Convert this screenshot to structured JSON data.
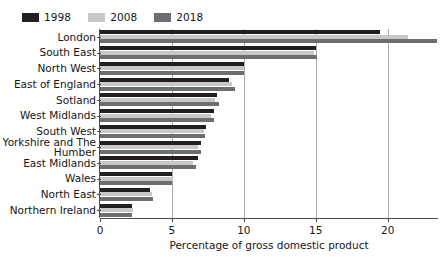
{
  "chart_data": {
    "type": "bar",
    "orientation": "horizontal",
    "title": "",
    "xlabel": "Percentage of gross domestic product",
    "ylabel": "",
    "xlim": [
      0,
      23.5
    ],
    "xticks": [
      0,
      5,
      10,
      15,
      20
    ],
    "grid": "vertical",
    "legend_position": "top-left",
    "categories": [
      "London",
      "South East",
      "North West",
      "East of England",
      "Sotland",
      "West Midlands",
      "South West",
      "Yorkshire and The Humber",
      "East Midlands",
      "Wales",
      "North East",
      "Northern Ireland"
    ],
    "series": [
      {
        "name": "1998",
        "color": "#231f20",
        "values": [
          19.5,
          15.0,
          10.0,
          9.0,
          8.1,
          7.9,
          7.4,
          7.0,
          6.8,
          5.0,
          3.5,
          2.2
        ]
      },
      {
        "name": "2008",
        "color": "#c8c8c8",
        "values": [
          21.4,
          14.9,
          10.0,
          9.2,
          8.0,
          7.7,
          7.2,
          6.8,
          6.5,
          5.1,
          3.6,
          2.3
        ]
      },
      {
        "name": "2018",
        "color": "#6d6e71",
        "values": [
          23.4,
          15.1,
          10.0,
          9.4,
          8.3,
          7.9,
          7.3,
          7.0,
          6.7,
          5.0,
          3.7,
          2.2
        ]
      }
    ]
  },
  "legend": {
    "items": [
      {
        "label": "1998",
        "color": "#231f20",
        "swatch": "legend-swatch-1998"
      },
      {
        "label": "2008",
        "color": "#c8c8c8",
        "swatch": "legend-swatch-2008"
      },
      {
        "label": "2018",
        "color": "#6d6e71",
        "swatch": "legend-swatch-2018"
      }
    ]
  },
  "axis": {
    "x_title": "Percentage of gross domestic product",
    "x_tick_labels": [
      "0",
      "5",
      "10",
      "15",
      "20"
    ]
  },
  "colors": {
    "grid": "#a9a9a9",
    "axis": "#4a4a4a",
    "text": "#151515",
    "background": "#ffffff"
  }
}
